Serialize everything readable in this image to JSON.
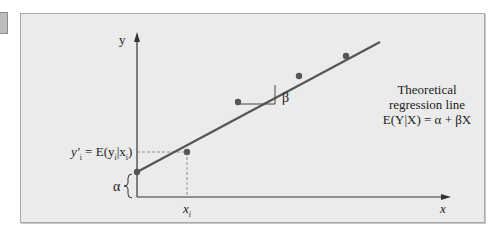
{
  "diagram": {
    "type": "regression-line-diagram",
    "axes": {
      "y_label": "y",
      "x_label": "x"
    },
    "labels": {
      "yi_prime": "y′",
      "yi_prime_sub": "i",
      "expectation": "= E(y",
      "expectation_sub": "i",
      "expectation_cond": "|x",
      "expectation_cond_sub": "i",
      "expectation_close": ")",
      "alpha": "α",
      "beta": "β",
      "xi": "x",
      "xi_sub": "i"
    },
    "caption": {
      "line1": "Theoretical",
      "line2": "regression line",
      "line3": "E(Y|X) = α + βX"
    },
    "line_points": [
      {
        "x": 137,
        "y": 172
      },
      {
        "x": 187,
        "y": 152
      },
      {
        "x": 238,
        "y": 102
      },
      {
        "x": 299,
        "y": 76
      },
      {
        "x": 346,
        "y": 56
      }
    ],
    "colors": {
      "panel_bg": "#ebebeb",
      "line": "#555555",
      "point": "#555555",
      "axis": "#333333",
      "dashed": "#777777"
    }
  }
}
